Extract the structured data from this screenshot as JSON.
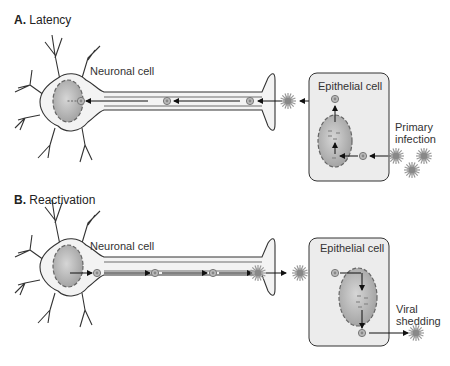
{
  "panels": [
    {
      "letter": "A.",
      "title": "Latency",
      "neuron_label": "Neuronal cell",
      "epithelial_label": "Epithelial cell",
      "side_label_line1": "Primary",
      "side_label_line2": "infection"
    },
    {
      "letter": "B.",
      "title": "Reactivation",
      "neuron_label": "Neuronal cell",
      "epithelial_label": "Epithelial cell",
      "side_label_line1": "Viral",
      "side_label_line2": "shedding"
    }
  ],
  "colors": {
    "outline": "#333333",
    "cell_fill": "#f0f0f0",
    "nucleus_fill": "#b8b8b8",
    "nucleus_dash": "#666666",
    "virus": "#999999"
  }
}
